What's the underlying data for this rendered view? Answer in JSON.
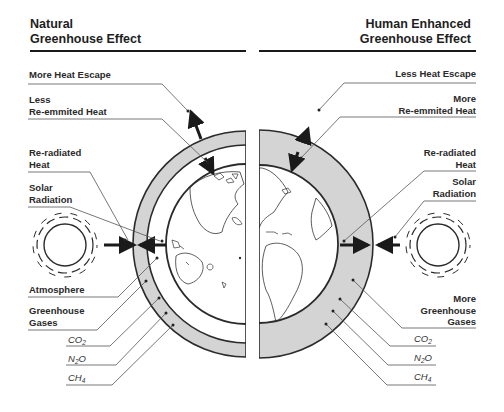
{
  "left_panel": {
    "title_line1": "Natural",
    "title_line2": "Greenhouse Effect",
    "labels": {
      "heat_escape": "More Heat Escape",
      "reemitted_line1": "Less",
      "reemitted_line2": "Re-emmited Heat",
      "reradiated_line1": "Re-radiated",
      "reradiated_line2": "Heat",
      "solar_line1": "Solar",
      "solar_line2": "Radiation",
      "atmosphere": "Atmosphere",
      "ghg_line1": "Greenhouse",
      "ghg_line2": "Gases"
    },
    "gases": [
      {
        "base": "CO",
        "sub": "2",
        "tail": ""
      },
      {
        "base": "N",
        "sub": "2",
        "tail": "O"
      },
      {
        "base": "CH",
        "sub": "4",
        "tail": ""
      }
    ]
  },
  "right_panel": {
    "title_line1": "Human Enhanced",
    "title_line2": "Greenhouse Effect",
    "labels": {
      "heat_escape": "Less Heat Escape",
      "reemitted_line1": "More",
      "reemitted_line2": "Re-emmited Heat",
      "reradiated_line1": "Re-radiated",
      "reradiated_line2": "Heat",
      "solar_line1": "Solar",
      "solar_line2": "Radiation",
      "ghg_line1": "More",
      "ghg_line2": "Greenhouse",
      "ghg_line3": "Gases"
    },
    "gases": [
      {
        "base": "CO",
        "sub": "2",
        "tail": ""
      },
      {
        "base": "N",
        "sub": "2",
        "tail": "O"
      },
      {
        "base": "CH",
        "sub": "4",
        "tail": ""
      }
    ]
  },
  "colors": {
    "gas_layer": "#d4d4d4",
    "outline": "#2b2b2b",
    "leader": "#555555"
  }
}
